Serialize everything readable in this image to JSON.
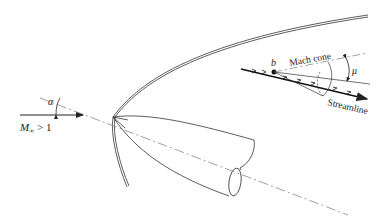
{
  "diagram": {
    "freestream": {
      "label": "M∞ > 1",
      "mach_symbol": "M",
      "mach_subscript": "∞",
      "condition": " > 1",
      "angle_label": "α"
    },
    "mach_cone": {
      "point_label": "b",
      "cone_label": "Mach cone",
      "angle_label": "μ",
      "streamline_label": "Streamline"
    },
    "colors": {
      "line": "#333333",
      "dashed": "#666666",
      "background": "#ffffff"
    }
  }
}
